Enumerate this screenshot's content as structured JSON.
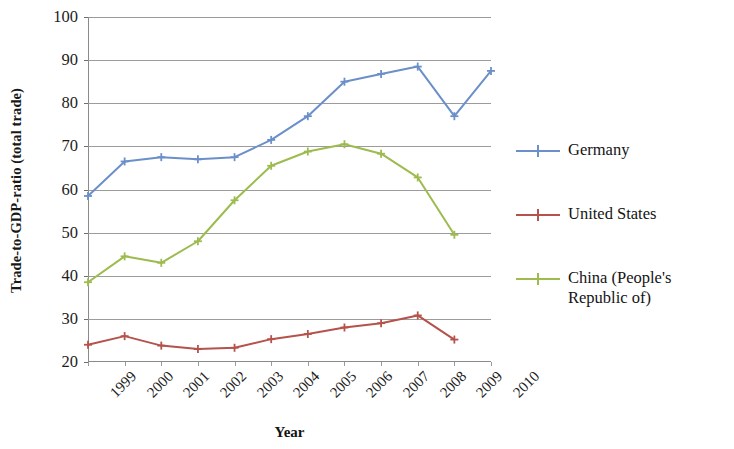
{
  "chart_data": {
    "type": "line",
    "title": "",
    "xlabel": "Year",
    "ylabel": "Trade-to-GDP-ratio (total trade)",
    "categories": [
      "1999",
      "2000",
      "2001",
      "2002",
      "2003",
      "2004",
      "2005",
      "2006",
      "2007",
      "2008",
      "2009",
      "2010"
    ],
    "x": [
      1999,
      2000,
      2001,
      2002,
      2003,
      2004,
      2005,
      2006,
      2007,
      2008,
      2009,
      2010
    ],
    "ylim": [
      20,
      100
    ],
    "yticks": [
      20,
      30,
      40,
      50,
      60,
      70,
      80,
      90,
      100
    ],
    "grid": true,
    "legend_position": "right",
    "series": [
      {
        "name": "Germany",
        "color": "#6B8FC9",
        "values": [
          58.5,
          66.5,
          67.5,
          67.0,
          67.5,
          71.5,
          77.0,
          85.0,
          86.8,
          88.5,
          77.0,
          87.5
        ]
      },
      {
        "name": "United States",
        "color": "#B5524B",
        "values": [
          24.0,
          26.0,
          23.8,
          23.0,
          23.3,
          25.3,
          26.5,
          28.0,
          29.0,
          30.8,
          25.2,
          null
        ]
      },
      {
        "name": "China (People's Republic of)",
        "color": "#9DBB4E",
        "values": [
          38.5,
          44.5,
          43.0,
          48.0,
          57.5,
          65.5,
          68.8,
          70.5,
          68.3,
          62.8,
          49.5,
          null
        ]
      }
    ]
  },
  "legend": {
    "entries": [
      {
        "label": "Germany",
        "color": "#6B8FC9"
      },
      {
        "label": "United States",
        "color": "#B5524B"
      },
      {
        "label": "China (People's Republic of)",
        "color": "#9DBB4E"
      }
    ]
  },
  "axes": {
    "y_title": "Trade-to-GDP-ratio (total trade)",
    "x_title": "Year",
    "y_tick_labels": [
      "100",
      "90",
      "80",
      "70",
      "60",
      "50",
      "40",
      "30",
      "20"
    ],
    "x_tick_labels": [
      "1999",
      "2000",
      "2001",
      "2002",
      "2003",
      "2004",
      "2005",
      "2006",
      "2007",
      "2008",
      "2009",
      "2010"
    ]
  }
}
